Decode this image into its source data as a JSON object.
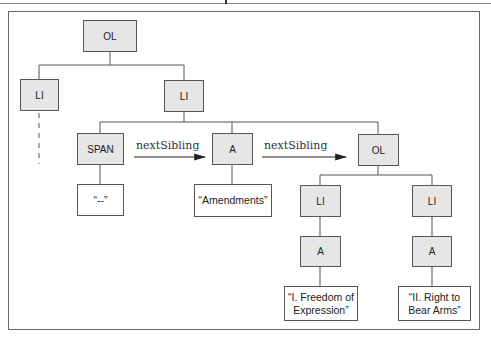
{
  "diagram": {
    "root": {
      "label": "OL"
    },
    "level1": [
      {
        "label": "LI",
        "note": "dashed-continuation"
      },
      {
        "label": "LI"
      }
    ],
    "level2": [
      {
        "label": "SPAN",
        "text": "“--”"
      },
      {
        "label": "A",
        "text": "“Amendments”"
      },
      {
        "label": "OL"
      }
    ],
    "arrows": [
      {
        "label": "nextSibling",
        "from": "SPAN",
        "to": "A"
      },
      {
        "label": "nextSibling",
        "from": "A",
        "to": "OL"
      }
    ],
    "level3": [
      {
        "li": "LI",
        "a": "A",
        "text_line1": "“I. Freedom of",
        "text_line2": "Expression”"
      },
      {
        "li": "LI",
        "a": "A",
        "text_line1": "“II. Right to",
        "text_line2": "Bear Arms”"
      }
    ]
  },
  "colors": {
    "element_fill": "#e6e6e6",
    "text_fill": "#ffffff",
    "stroke": "#555555"
  }
}
